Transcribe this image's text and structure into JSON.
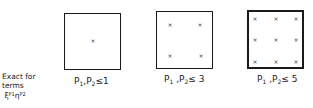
{
  "note": {
    "line1": "Exact for",
    "line2": "terms",
    "line3_base1": "ξ",
    "line3_exp1": "P1",
    "line3_base2": "η",
    "line3_exp2": "P2"
  },
  "panels": [
    {
      "caption_p1": "P",
      "caption_sub1": "1",
      "caption_sep": ",",
      "caption_p2": "P",
      "caption_sub2": "2",
      "caption_rel": "≤1",
      "points": 1,
      "grid": "1x1"
    },
    {
      "caption_p1": "P",
      "caption_sub1": "1",
      "caption_sep": " ,",
      "caption_p2": "P",
      "caption_sub2": "2",
      "caption_rel": "≤ 3",
      "points": 4,
      "grid": "2x2"
    },
    {
      "caption_p1": "P",
      "caption_sub1": "1",
      "caption_sep": " ,",
      "caption_p2": "P",
      "caption_sub2": "2",
      "caption_rel": "≤ 5",
      "points": 9,
      "grid": "3x3"
    }
  ],
  "marker": "×"
}
